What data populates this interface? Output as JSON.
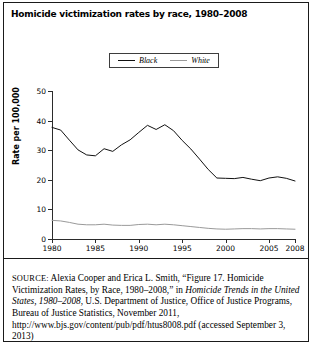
{
  "figure": {
    "title": "Homicide victimization rates by race, 1980–2008"
  },
  "legend": {
    "position": "top-center",
    "items": [
      {
        "label": "Black",
        "color": "#111111"
      },
      {
        "label": "White",
        "color": "#9a9a9a"
      }
    ]
  },
  "axes": {
    "y_title": "Rate per 100,000",
    "y_ticks": [
      "0",
      "10",
      "20",
      "30",
      "40",
      "50"
    ],
    "x_ticks": [
      "1980",
      "1985",
      "1990",
      "1995",
      "2000",
      "2005",
      "2008"
    ]
  },
  "source": {
    "prefix": "SOURCE:",
    "part1": " Alexia Cooper and Erica L. Smith, “Figure 17. Homicide Victimization Rates, by Race, 1980–2008,” in ",
    "italic1": "Homicide Trends in the United States, 1980–2008",
    "part2": ", U.S. Department of Justice, Office of Justice Programs, Bureau of Justice Statistics, November 2011, http://www.bjs.gov/content/pub/pdf/htus8008.pdf (accessed September 3, 2013)"
  },
  "chart_data": {
    "type": "line",
    "title": "Homicide victimization rates by race, 1980–2008",
    "xlabel": "",
    "ylabel": "Rate per 100,000",
    "xlim": [
      1980,
      2008
    ],
    "ylim": [
      0,
      50
    ],
    "grid": false,
    "legend_position": "top-center",
    "x": [
      1980,
      1981,
      1982,
      1983,
      1984,
      1985,
      1986,
      1987,
      1988,
      1989,
      1990,
      1991,
      1992,
      1993,
      1994,
      1995,
      1996,
      1997,
      1998,
      1999,
      2000,
      2001,
      2002,
      2003,
      2004,
      2005,
      2006,
      2007,
      2008
    ],
    "series": [
      {
        "name": "Black",
        "color": "#111111",
        "values": [
          37.7,
          36.8,
          33.4,
          30.1,
          28.4,
          28.1,
          30.5,
          29.6,
          31.8,
          33.5,
          36.0,
          38.4,
          37.0,
          38.6,
          36.6,
          33.3,
          30.4,
          27.0,
          23.5,
          20.6,
          20.5,
          20.4,
          20.8,
          20.2,
          19.7,
          20.6,
          21.0,
          20.5,
          19.6
        ]
      },
      {
        "name": "White",
        "color": "#9a9a9a",
        "values": [
          6.3,
          6.1,
          5.6,
          5.0,
          4.8,
          4.8,
          5.0,
          4.7,
          4.6,
          4.6,
          4.9,
          5.0,
          4.8,
          5.0,
          4.8,
          4.5,
          4.2,
          3.9,
          3.6,
          3.4,
          3.3,
          3.4,
          3.5,
          3.5,
          3.4,
          3.5,
          3.5,
          3.4,
          3.3
        ]
      }
    ]
  }
}
